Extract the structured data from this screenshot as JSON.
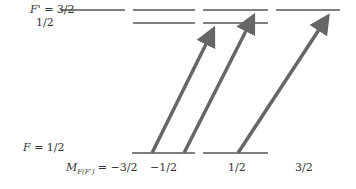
{
  "diagram": {
    "upper_level": {
      "label_prefix": "F'",
      "label_eq": " = 3/2",
      "sub_label": "1/2"
    },
    "lower_level": {
      "label_prefix": "F",
      "label_eq": " = 1/2"
    },
    "m_axis": {
      "label_prefix": "M",
      "label_sub": "F(F')",
      "label_eq": " = −3/2",
      "values": [
        "−1/2",
        "1/2",
        "3/2"
      ]
    },
    "colors": {
      "line": "#555555",
      "arrow": "#666666",
      "text": "#333333"
    },
    "arrows": [
      {
        "from_m": "-1/2",
        "to_level": "F'=1/2 or 3/2"
      },
      {
        "from_m": "-1/2",
        "to_level": "F'=3/2"
      },
      {
        "from_m": "1/2",
        "to_level": "F'=3/2"
      }
    ]
  }
}
